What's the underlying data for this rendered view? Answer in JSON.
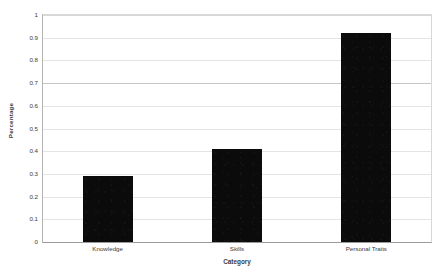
{
  "chart_data": {
    "type": "bar",
    "title": "",
    "subtitle": "",
    "categories": [
      "Knowledge",
      "Skills",
      "Personal Traits"
    ],
    "values": [
      0.29,
      0.41,
      0.92
    ],
    "xlabel": "Category",
    "ylabel": "Percentage",
    "ylim": [
      0,
      1
    ],
    "ytick_labels": [
      "1",
      "0.9",
      "0.8",
      "0.7",
      "0.6",
      "0.5",
      "0.4",
      "0.3",
      "0.2",
      "0.1",
      "0"
    ],
    "ytick_values": [
      1,
      0.9,
      0.8,
      0.7,
      0.6,
      0.5,
      0.4,
      0.3,
      0.2,
      0.1,
      0
    ],
    "grid": true,
    "grid_axis": "y",
    "legend": false,
    "legend_position": "none",
    "series": [
      {
        "name": "Percentage",
        "color": "#0b0b0b",
        "values": [
          0.29,
          0.41,
          0.92
        ]
      }
    ],
    "colors": {
      "bar": "#0b0b0b",
      "gridline": "#e4e4e4",
      "gridline_major": "#c6c6c6",
      "axis": "#9a9a9a",
      "text": "#3a3a3a",
      "background": "#ffffff"
    }
  }
}
